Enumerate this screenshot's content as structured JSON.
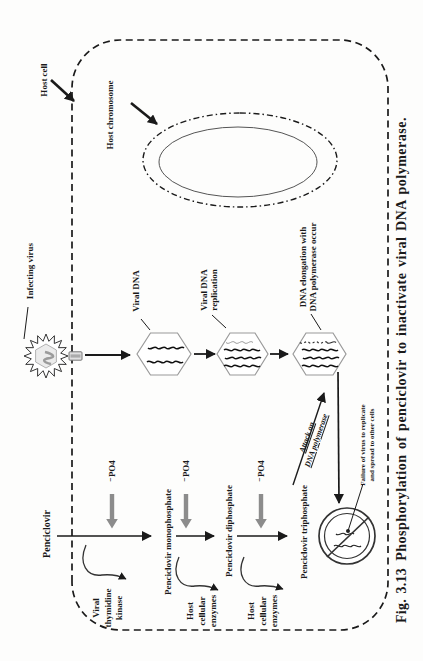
{
  "caption": {
    "label": "Fig. 3.13",
    "text": "Phosphorylation of penciclovir to inactivate viral DNA polymerase."
  },
  "labels": {
    "host_cell": "Host cell",
    "host_chromosome": "Host chromosome",
    "infecting_virus": "Infecting virus",
    "viral_dna": "Viral DNA",
    "viral_dna_replication": [
      "Viral DNA",
      "replication"
    ],
    "dna_elongation": [
      "DNA elongation with",
      "DNA polymerase occur"
    ],
    "attack": [
      "Attack on",
      "DNA polymerase"
    ],
    "failure": [
      "Failure of virus to replicate",
      "and spread to other cells"
    ]
  },
  "pathway": {
    "steps": [
      "Penciclovir",
      "Penciclovir monophosphate",
      "Penciclovir diphosphate",
      "Penciclovir triphosphate"
    ],
    "po4": "⁻PO4",
    "enzyme1": [
      "Viral",
      "thymidine",
      "kinase"
    ],
    "enzyme2": [
      "Host",
      "cellular",
      "enzymes"
    ],
    "enzyme3": [
      "Host",
      "cellular",
      "enzymes"
    ]
  },
  "colors": {
    "ink": "#1a1a1a",
    "gray_arrow": "#8c8c8c",
    "hexagon_outline": "#9a9a9a"
  }
}
